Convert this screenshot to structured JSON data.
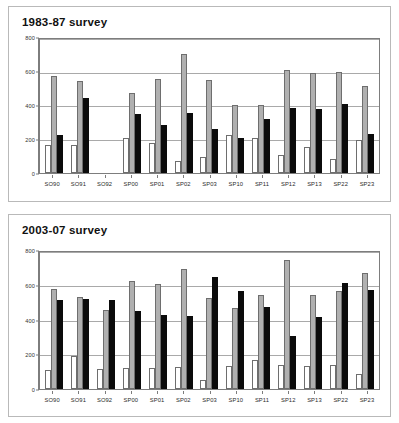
{
  "figure": {
    "background": "#ffffff",
    "panel_border": "#b9b9b9"
  },
  "colors": {
    "series_white": "#ffffff",
    "series_gray": "#b0b0b0",
    "series_black": "#0b0b0b",
    "axis": "#7d7d7d",
    "grid": "#a9a9a9",
    "text": "#1a1a1a"
  },
  "panels": [
    {
      "id": "panel-1",
      "title": "1983-87 survey"
    },
    {
      "id": "panel-2",
      "title": "2003-07 survey"
    }
  ],
  "chart_data": [
    {
      "type": "bar",
      "title": "1983-87 survey",
      "xlabel": "",
      "ylabel": "",
      "ylim": [
        0,
        800
      ],
      "yticks": [
        0,
        200,
        400,
        600,
        800
      ],
      "ytick_labels": [
        "0",
        "200",
        "400",
        "600",
        "800"
      ],
      "grid": true,
      "legend": "none",
      "categories": [
        "SO90",
        "SO91",
        "SO92",
        "SP00",
        "SP01",
        "SP02",
        "SP03",
        "SP10",
        "SP11",
        "SP12",
        "SP13",
        "SP22",
        "SP23"
      ],
      "series": [
        {
          "name": "series-1-white",
          "color": "#ffffff",
          "values": [
            170,
            165,
            0,
            212,
            178,
            72,
            95,
            225,
            212,
            108,
            155,
            82,
            196
          ]
        },
        {
          "name": "series-2-gray",
          "color": "#b0b0b0",
          "values": [
            580,
            552,
            0,
            478,
            560,
            712,
            558,
            408,
            408,
            615,
            597,
            605,
            522
          ]
        },
        {
          "name": "series-3-black",
          "color": "#0b0b0b",
          "values": [
            225,
            445,
            0,
            350,
            288,
            358,
            265,
            208,
            325,
            390,
            380,
            410,
            235
          ]
        }
      ]
    },
    {
      "type": "bar",
      "title": "2003-07 survey",
      "xlabel": "",
      "ylabel": "",
      "ylim": [
        0,
        800
      ],
      "yticks": [
        0,
        200,
        400,
        600,
        800
      ],
      "ytick_labels": [
        "0",
        "200",
        "400",
        "600",
        "800"
      ],
      "grid": true,
      "legend": "none",
      "categories": [
        "SO90",
        "SO91",
        "SO92",
        "SP00",
        "SP01",
        "SP02",
        "SP03",
        "SP10",
        "SP11",
        "SP12",
        "SP13",
        "SP22",
        "SP23"
      ],
      "series": [
        {
          "name": "series-1-white",
          "color": "#ffffff",
          "values": [
            112,
            190,
            118,
            125,
            120,
            130,
            55,
            132,
            172,
            140,
            133,
            140,
            85
          ]
        },
        {
          "name": "series-2-gray",
          "color": "#b0b0b0",
          "values": [
            582,
            537,
            460,
            630,
            612,
            698,
            530,
            475,
            550,
            755,
            547,
            575,
            675
          ]
        },
        {
          "name": "series-3-black",
          "color": "#0b0b0b",
          "values": [
            518,
            528,
            522,
            458,
            435,
            425,
            655,
            575,
            480,
            308,
            418,
            618,
            578
          ]
        }
      ]
    }
  ]
}
